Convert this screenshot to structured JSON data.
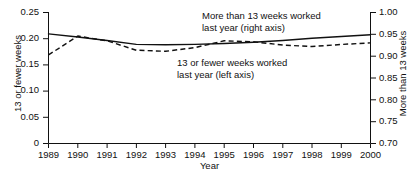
{
  "chart_data": {
    "type": "line",
    "title": "",
    "xlabel": "Year",
    "ylabel": "13 or fewer weeks",
    "ylabel_right": "More than 13 weeks",
    "x": [
      1989,
      1990,
      1991,
      1992,
      1993,
      1994,
      1995,
      1996,
      1997,
      1998,
      1999,
      2000
    ],
    "xlim": [
      1989,
      2000
    ],
    "ylim": [
      0,
      0.25
    ],
    "ylim_right": [
      0.7,
      1.0
    ],
    "grid": false,
    "legend_position": "inline-annotations",
    "xticks": [
      "1989",
      "1990",
      "1991",
      "1992",
      "1993",
      "1994",
      "1995",
      "1996",
      "1997",
      "1998",
      "1999",
      "2000"
    ],
    "yticks_left": [
      "0",
      "0.05",
      "0.10",
      "0.15",
      "0.20",
      "0.25"
    ],
    "yticks_right": [
      "0.70",
      "0.75",
      "0.80",
      "0.85",
      "0.90",
      "0.95",
      "1.00"
    ],
    "series": [
      {
        "name": "More than 13 weeks worked last year (right axis)",
        "axis": "right",
        "style": "solid",
        "color": "#111111",
        "values": [
          0.951,
          0.944,
          0.936,
          0.927,
          0.926,
          0.927,
          0.929,
          0.932,
          0.936,
          0.941,
          0.945,
          0.949
        ]
      },
      {
        "name": "13 or fewer weeks worked last year (left axis)",
        "axis": "left",
        "style": "dashed",
        "color": "#111111",
        "values": [
          0.169,
          0.205,
          0.196,
          0.178,
          0.176,
          0.183,
          0.196,
          0.194,
          0.188,
          0.185,
          0.189,
          0.192
        ]
      }
    ],
    "annotations": [
      {
        "id": "legend-more",
        "lines": [
          "More than 13 weeks worked",
          "last year (right axis)"
        ]
      },
      {
        "id": "legend-fewer",
        "lines": [
          "13 or fewer weeks worked",
          "last year (left axis)"
        ]
      }
    ]
  },
  "axes": {
    "x_title": "Year",
    "y_left_title": "13 or fewer weeks",
    "y_right_title": "More than 13 weeks"
  },
  "ticks": {
    "x": [
      "1989",
      "1990",
      "1991",
      "1992",
      "1993",
      "1994",
      "1995",
      "1996",
      "1997",
      "1998",
      "1999",
      "2000"
    ],
    "y_left": [
      "0.25",
      "0.20",
      "0.15",
      "0.10",
      "0.05",
      "0"
    ],
    "y_right": [
      "1.00",
      "0.95",
      "0.90",
      "0.85",
      "0.80",
      "0.75",
      "0.70"
    ]
  },
  "legend": {
    "more_line1": "More than 13 weeks worked",
    "more_line2": "last year (right axis)",
    "fewer_line1": "13 or fewer weeks worked",
    "fewer_line2": "last year (left axis)"
  },
  "footer": {
    "cut_text": ""
  }
}
